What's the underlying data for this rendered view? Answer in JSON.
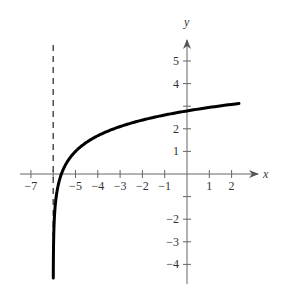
{
  "chart_data": {
    "type": "line",
    "title": "",
    "xlabel": "x",
    "ylabel": "y",
    "xlim": [
      -7.5,
      3.1
    ],
    "ylim": [
      -4.7,
      6.0
    ],
    "x_ticks": [
      -7,
      -6,
      -5,
      -4,
      -3,
      -2,
      -1,
      1,
      2
    ],
    "x_tick_labels": [
      "-7",
      "",
      "-5",
      "-4",
      "-3",
      "-2",
      "-1",
      "1",
      "2"
    ],
    "y_ticks": [
      -4,
      -3,
      -2,
      -1,
      1,
      2,
      3,
      4,
      5
    ],
    "y_tick_labels": [
      "-4",
      "-3",
      "-2",
      "",
      "1",
      "2",
      "",
      "4",
      "5"
    ],
    "grid": false,
    "legend": null,
    "asymptote": {
      "type": "vertical",
      "x": -6,
      "style": "dashed"
    },
    "series": [
      {
        "name": "f(x)",
        "description": "logarithmic curve approx y = ln(x+6) + 1",
        "x": [
          -5.996,
          -5.99,
          -5.98,
          -5.95,
          -5.9,
          -5.8,
          -5.63,
          -5.5,
          -5.0,
          -4.5,
          -4.0,
          -3.0,
          -2.0,
          -1.0,
          0.0,
          1.0,
          2.0,
          2.4
        ],
        "values": [
          -4.52,
          -3.61,
          -2.91,
          -2.0,
          -1.3,
          -0.61,
          0.0,
          0.31,
          1.0,
          1.41,
          1.69,
          2.1,
          2.38,
          2.95,
          2.79,
          2.95,
          3.08,
          3.13
        ]
      }
    ]
  }
}
